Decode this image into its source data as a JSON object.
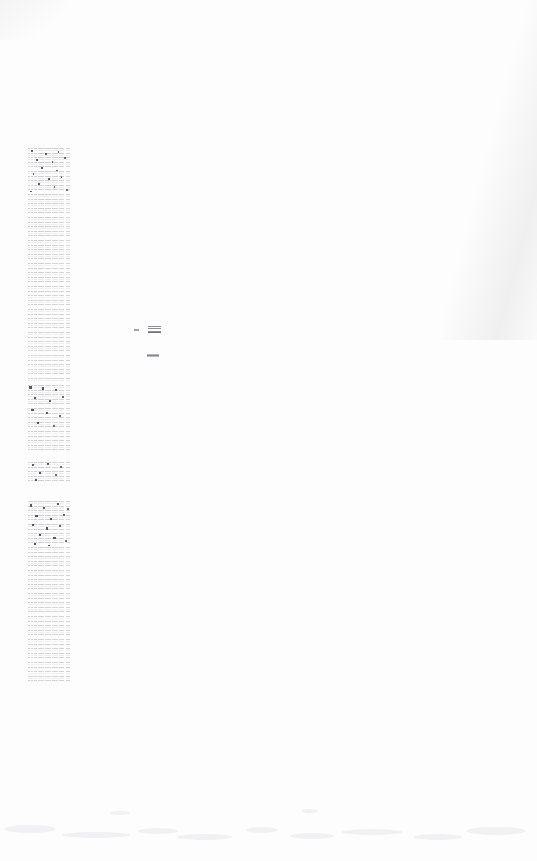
{
  "document": {
    "kind": "scanned-page",
    "page_background_color": "#fdfdfd",
    "ink_color": "#5f5f68",
    "width_px": 537,
    "height_px": 861,
    "legibility_note": "Body type is rendered at roughly one-pixel stroke width and is not resolvable at any magnification; no words are transcribable from the pixels."
  },
  "layout": {
    "column": {
      "left_px": 28,
      "top_px": 148,
      "width_px": 42,
      "alignment": "left-margin single column"
    }
  },
  "column_blocks": [
    {
      "id": "block-1",
      "top_px": 148,
      "height_px": 233,
      "approx_lines": 50,
      "text": ""
    },
    {
      "id": "block-2",
      "top_px": 385,
      "height_px": 65,
      "approx_lines": 14,
      "text": ""
    },
    {
      "id": "block-3",
      "top_px": 462,
      "height_px": 21,
      "approx_lines": 4,
      "text": ""
    },
    {
      "id": "block-4",
      "top_px": 501,
      "height_px": 182,
      "approx_lines": 39,
      "text": ""
    }
  ],
  "marks": [
    {
      "id": "mark-tick",
      "name": "tick-mark",
      "left_px": 134,
      "top_px": 329,
      "text": ""
    },
    {
      "id": "mark-stamp",
      "name": "stamp-mark",
      "left_px": 148,
      "top_px": 326,
      "text": ""
    },
    {
      "id": "mark-dash",
      "name": "dash-mark",
      "left_px": 147,
      "top_px": 354,
      "text": ""
    }
  ]
}
